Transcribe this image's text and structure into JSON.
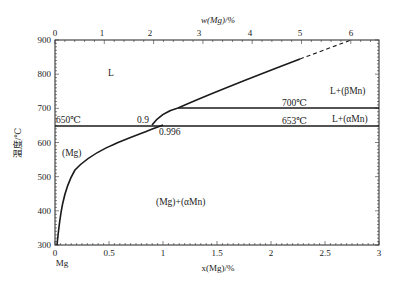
{
  "chart_data": {
    "type": "line",
    "title": "",
    "xlabel": "x(Mg)/%",
    "x2label": "w(Mg)/%",
    "ylabel": "温度/℃",
    "xlim": [
      0,
      3
    ],
    "x2lim": [
      0,
      6.4
    ],
    "ylim": [
      300,
      900
    ],
    "x_ticks": [
      "0",
      "0.5",
      "1",
      "1.5",
      "2",
      "2.5",
      "3"
    ],
    "x2_ticks": [
      "0",
      "1",
      "2",
      "3",
      "4",
      "5",
      "6"
    ],
    "y_ticks": [
      "300",
      "400",
      "500",
      "600",
      "700",
      "800",
      "900"
    ],
    "x_origin_label": "Mg",
    "grid": false,
    "series": [
      {
        "name": "liquidus",
        "style": "solid",
        "points": [
          [
            0.9,
            650
          ],
          [
            1.0,
            668
          ],
          [
            1.14,
            700
          ],
          [
            1.5,
            740
          ],
          [
            2.0,
            790
          ],
          [
            2.3,
            820
          ]
        ]
      },
      {
        "name": "liquidus-extrapolated",
        "style": "dashed",
        "points": [
          [
            2.3,
            820
          ],
          [
            2.8,
            900
          ]
        ]
      },
      {
        "name": "solvus",
        "style": "solid",
        "points": [
          [
            0.01,
            300
          ],
          [
            0.05,
            400
          ],
          [
            0.2,
            500
          ],
          [
            0.5,
            575
          ],
          [
            0.8,
            625
          ],
          [
            0.996,
            653
          ]
        ]
      },
      {
        "name": "peritectic-700",
        "style": "solid",
        "points": [
          [
            1.14,
            700
          ],
          [
            3.0,
            700
          ]
        ]
      },
      {
        "name": "isotherm-653",
        "style": "solid",
        "points": [
          [
            0.0,
            650
          ],
          [
            3.0,
            650
          ]
        ]
      }
    ],
    "annotations": [
      {
        "text": "L",
        "x": 0.5,
        "y": 820
      },
      {
        "text": "L+(βMn)",
        "x": 2.7,
        "y": 730
      },
      {
        "text": "700℃",
        "x": 2.05,
        "y": 710
      },
      {
        "text": "L+(αMn)",
        "x": 2.7,
        "y": 665
      },
      {
        "text": "653℃",
        "x": 2.05,
        "y": 660
      },
      {
        "text": "650℃",
        "x": 0.02,
        "y": 658
      },
      {
        "text": "0.9",
        "x": 0.83,
        "y": 660
      },
      {
        "text": "0.996",
        "x": 1.0,
        "y": 635
      },
      {
        "text": "(Mg)",
        "x": 0.15,
        "y": 600
      },
      {
        "text": "(Mg)+(αMn)",
        "x": 1.55,
        "y": 465
      }
    ]
  },
  "labels": {
    "ylabel": "温度/℃",
    "xlabel": "x(Mg)/%",
    "x2label": "w(Mg)/%",
    "mg": "Mg",
    "L": "L",
    "LbMn": "L+(βMn)",
    "LaMn": "L+(αMn)",
    "t700": "700℃",
    "t653": "653℃",
    "t650": "650℃",
    "p09": "0.9",
    "p0996": "0.996",
    "Mg": "(Mg)",
    "MgaMn": "(Mg)+(αMn)"
  }
}
